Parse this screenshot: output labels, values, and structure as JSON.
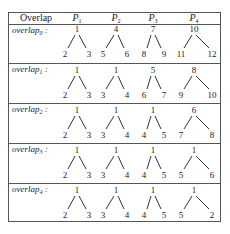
{
  "table": {
    "header": {
      "first_col": "Overlap",
      "columns": [
        {
          "base": "P",
          "sub": "1"
        },
        {
          "base": "P",
          "sub": "2"
        },
        {
          "base": "P",
          "sub": "3"
        },
        {
          "base": "P",
          "sub": "4"
        }
      ]
    },
    "rows": [
      {
        "label_base": "overlap",
        "label_sub": "0",
        "label_suffix": " :",
        "trees": [
          {
            "root": "1",
            "left": "2",
            "right": "3"
          },
          {
            "root": "4",
            "left": "5",
            "right": "6"
          },
          {
            "root": "7",
            "left": "8",
            "right": "9"
          },
          {
            "root": "10",
            "left": "11",
            "right": "12"
          }
        ]
      },
      {
        "label_base": "overlap",
        "label_sub": "1",
        "label_suffix": " :",
        "trees": [
          {
            "root": "1",
            "left": "2",
            "right": "3"
          },
          {
            "root": "1",
            "left": "3",
            "right": "4"
          },
          {
            "root": "5",
            "left": "6",
            "right": "7"
          },
          {
            "root": "8",
            "left": "9",
            "right": "10"
          }
        ]
      },
      {
        "label_base": "overlap",
        "label_sub": "2",
        "label_suffix": " :",
        "trees": [
          {
            "root": "1",
            "left": "2",
            "right": "3"
          },
          {
            "root": "1",
            "left": "3",
            "right": "4"
          },
          {
            "root": "1",
            "left": "4",
            "right": "5"
          },
          {
            "root": "6",
            "left": "7",
            "right": "8"
          }
        ]
      },
      {
        "label_base": "overlap",
        "label_sub": "3",
        "label_suffix": " :",
        "trees": [
          {
            "root": "1",
            "left": "2",
            "right": "3"
          },
          {
            "root": "1",
            "left": "3",
            "right": "4"
          },
          {
            "root": "1",
            "left": "4",
            "right": "5"
          },
          {
            "root": "1",
            "left": "5",
            "right": "6"
          }
        ]
      },
      {
        "label_base": "overlap",
        "label_sub": "4",
        "label_suffix": " :",
        "trees": [
          {
            "root": "1",
            "left": "2",
            "right": "3"
          },
          {
            "root": "1",
            "left": "3",
            "right": "4"
          },
          {
            "root": "1",
            "left": "4",
            "right": "5"
          },
          {
            "root": "1",
            "left": "5",
            "right": "2"
          }
        ]
      }
    ]
  }
}
